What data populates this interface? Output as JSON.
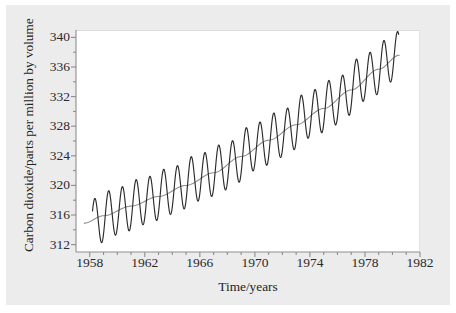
{
  "figure": {
    "background_color": "#ececed",
    "plot_background_color": "#ffffff",
    "curve_color": "#2b2b2b",
    "trend_color": "#8a8a8a"
  },
  "chart_data": {
    "type": "line",
    "title": "",
    "xlabel": "Time/years",
    "ylabel": "Carbon dioxide/parts per million by volume",
    "xlim": [
      1957.0,
      1982.0
    ],
    "ylim": [
      311.0,
      341.0
    ],
    "xticks": [
      1958,
      1962,
      1966,
      1970,
      1974,
      1978,
      1982
    ],
    "xtick_labels": [
      "1958",
      "1962",
      "1966",
      "1970",
      "1974",
      "1978",
      "1982"
    ],
    "xminor_tick_step": 1,
    "yticks": [
      312,
      316,
      320,
      324,
      328,
      332,
      336,
      340
    ],
    "ytick_labels": [
      "312",
      "316",
      "320",
      "324",
      "328",
      "332",
      "336",
      "340"
    ],
    "yminor_tick_step": 2,
    "grid": false,
    "legend": null,
    "series": [
      {
        "name": "Monthly mean CO2 concentration",
        "style": "oscillating",
        "color": "#2b2b2b",
        "x_start": 1958.2,
        "x_end": 1980.45,
        "seasonal_amplitude_ppm": 3.2,
        "seasonal_peak_month_fraction": 0.37,
        "trend_anchors_x": [
          1958.2,
          1960.0,
          1962.0,
          1964.0,
          1966.0,
          1968.0,
          1970.0,
          1972.0,
          1974.0,
          1976.0,
          1978.0,
          1980.45
        ],
        "trend_anchors_y": [
          315.0,
          316.5,
          317.9,
          319.3,
          321.1,
          322.6,
          325.2,
          327.0,
          329.6,
          331.4,
          334.6,
          337.6
        ]
      },
      {
        "name": "Smoothed annual trend",
        "style": "smooth",
        "color": "#8a8a8a",
        "x_start": 1957.6,
        "x_end": 1980.5,
        "anchors_x": [
          1957.6,
          1959.0,
          1961.0,
          1963.0,
          1965.0,
          1967.0,
          1969.0,
          1971.0,
          1973.0,
          1975.0,
          1977.0,
          1979.0,
          1980.5
        ],
        "anchors_y": [
          314.9,
          315.9,
          317.2,
          318.5,
          320.0,
          321.7,
          323.9,
          326.1,
          328.2,
          330.4,
          332.9,
          335.7,
          337.6
        ]
      }
    ],
    "annual_mean_points": [
      {
        "year": 1958,
        "co2": 315.3
      },
      {
        "year": 1959,
        "co2": 315.9
      },
      {
        "year": 1960,
        "co2": 316.9
      },
      {
        "year": 1961,
        "co2": 317.6
      },
      {
        "year": 1962,
        "co2": 318.4
      },
      {
        "year": 1963,
        "co2": 318.9
      },
      {
        "year": 1964,
        "co2": 319.6
      },
      {
        "year": 1965,
        "co2": 320.0
      },
      {
        "year": 1966,
        "co2": 321.4
      },
      {
        "year": 1967,
        "co2": 322.2
      },
      {
        "year": 1968,
        "co2": 323.0
      },
      {
        "year": 1969,
        "co2": 324.6
      },
      {
        "year": 1970,
        "co2": 325.7
      },
      {
        "year": 1971,
        "co2": 326.3
      },
      {
        "year": 1972,
        "co2": 327.5
      },
      {
        "year": 1973,
        "co2": 329.7
      },
      {
        "year": 1974,
        "co2": 330.2
      },
      {
        "year": 1975,
        "co2": 331.1
      },
      {
        "year": 1976,
        "co2": 332.0
      },
      {
        "year": 1977,
        "co2": 333.8
      },
      {
        "year": 1978,
        "co2": 335.4
      },
      {
        "year": 1979,
        "co2": 336.8
      },
      {
        "year": 1980,
        "co2": 338.7
      }
    ]
  }
}
